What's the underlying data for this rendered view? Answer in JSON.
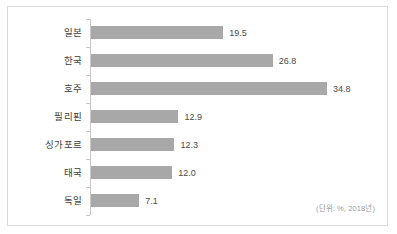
{
  "footnote": "(단위: %, 2018년)",
  "colors": {
    "bar": "#a8a8a8",
    "frame": "#d9d9d9",
    "axis": "#c9c9c9",
    "label_text": "#3d3d3d",
    "value_text": "#4a4a4a",
    "footnote_text": "#9a9a9a",
    "background": "#ffffff"
  },
  "chart_data": {
    "type": "bar",
    "orientation": "horizontal",
    "title": "",
    "subtitle": "",
    "xlabel": "",
    "ylabel": "",
    "categories": [
      "일본",
      "한국",
      "호주",
      "필리핀",
      "싱가포르",
      "태국",
      "독일"
    ],
    "values": [
      19.5,
      26.8,
      34.8,
      12.9,
      12.3,
      12.0,
      7.1
    ],
    "value_labels": [
      "19.5",
      "26.8",
      "34.8",
      "12.9",
      "12.3",
      "12.0",
      "7.1"
    ],
    "xlim": [
      0,
      34.8
    ],
    "grid": false,
    "legend": false,
    "annotations": [
      "(단위: %, 2018년)"
    ]
  }
}
